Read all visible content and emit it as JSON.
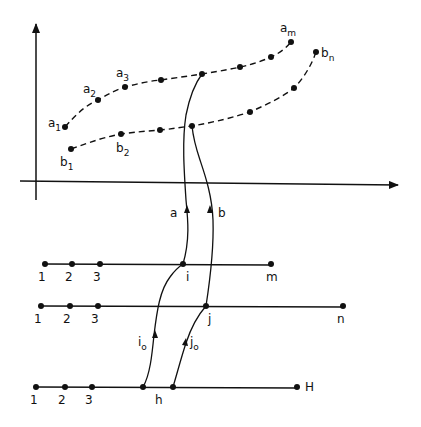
{
  "diagram": {
    "colors": {
      "ink": "#111111",
      "background": "#ffffff"
    },
    "axes": {
      "y_axis": {
        "x": 36,
        "y_top": 22,
        "y_bottom": 200
      },
      "x_axis": {
        "y": 182,
        "x_left": 20,
        "x_right": 400
      }
    },
    "curves": {
      "a": {
        "points": [
          [
            65,
            127
          ],
          [
            98,
            100
          ],
          [
            125,
            87
          ],
          [
            161,
            80
          ],
          [
            202,
            74
          ],
          [
            240,
            67
          ],
          [
            271,
            57
          ],
          [
            291,
            42
          ]
        ],
        "labels": [
          {
            "base": "a",
            "sub": "1",
            "x": 48,
            "y": 127
          },
          {
            "base": "a",
            "sub": "2",
            "x": 83,
            "y": 93
          },
          {
            "base": "a",
            "sub": "3",
            "x": 116,
            "y": 77
          },
          {
            "base": "a",
            "sub": "m",
            "x": 280,
            "y": 32
          }
        ]
      },
      "b": {
        "points": [
          [
            71,
            149
          ],
          [
            121,
            134
          ],
          [
            160,
            130
          ],
          [
            192,
            126
          ],
          [
            250,
            112
          ],
          [
            294,
            88
          ],
          [
            316,
            52
          ]
        ],
        "labels": [
          {
            "base": "b",
            "sub": "1",
            "x": 60,
            "y": 166
          },
          {
            "base": "b",
            "sub": "2",
            "x": 116,
            "y": 152
          },
          {
            "base": "b",
            "sub": "n",
            "x": 321,
            "y": 57
          }
        ]
      }
    },
    "paths": {
      "a": {
        "label": "a",
        "label_x": 170,
        "label_y": 217
      },
      "b": {
        "label": "b",
        "label_x": 219,
        "label_y": 217
      },
      "i0": {
        "label": "i",
        "sub": "o",
        "label_x": 141,
        "label_y": 345
      },
      "j0": {
        "label": "j",
        "sub": "o",
        "label_x": 191,
        "label_y": 345
      }
    },
    "lines": [
      {
        "name": "line-m",
        "y": 264,
        "x_start": 45,
        "x_end": 271,
        "dots": [
          45,
          72,
          100,
          183,
          271
        ],
        "tick_labels": [
          "1",
          "2",
          "3"
        ],
        "tick_label_x": [
          38,
          65,
          93
        ],
        "special": [
          {
            "label": "i",
            "x": 186
          },
          {
            "label": "m",
            "x": 266
          }
        ],
        "label_y": 281
      },
      {
        "name": "line-n",
        "y": 306,
        "x_start": 41,
        "x_end": 343,
        "dots": [
          41,
          70,
          98,
          206,
          343
        ],
        "tick_labels": [
          "1",
          "2",
          "3"
        ],
        "tick_label_x": [
          34,
          63,
          91
        ],
        "special": [
          {
            "label": "j",
            "x": 208
          },
          {
            "label": "n",
            "x": 337
          }
        ],
        "label_y": 323
      },
      {
        "name": "line-H",
        "y": 387,
        "x_start": 36,
        "x_end": 297,
        "dots": [
          36,
          65,
          92,
          143,
          173,
          297
        ],
        "tick_labels": [
          "1",
          "2",
          "3"
        ],
        "tick_label_x": [
          30,
          58,
          85
        ],
        "special": [
          {
            "label": "h",
            "x": 155,
            "y": 404
          },
          {
            "label": "H",
            "x": 305,
            "y": 391
          }
        ],
        "label_y": 404
      }
    ],
    "node_labels": {
      "i": "i",
      "j": "j",
      "h": "h",
      "m": "m",
      "n": "n",
      "H": "H"
    }
  }
}
